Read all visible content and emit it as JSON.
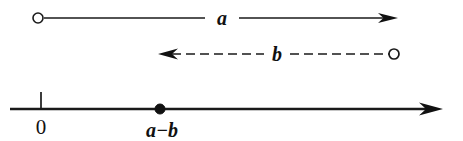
{
  "figure": {
    "background_color": "#ffffff",
    "ink_color": "#111111",
    "width": 463,
    "height": 141
  },
  "vectors": [
    {
      "id": "vector-a",
      "label": "a",
      "style": "solid",
      "direction": "right",
      "start_marker": "open-circle",
      "end_marker": "arrowhead",
      "start_x": 38,
      "end_x": 398,
      "y": 18,
      "label_x": 222,
      "label_y": 24,
      "label_gap_left": 205,
      "label_gap_right": 239,
      "stroke_width": 1.6
    },
    {
      "id": "vector-b",
      "label": "b",
      "style": "dashed",
      "direction": "left",
      "start_marker": "arrowhead",
      "end_marker": "open-circle",
      "start_x": 158,
      "end_x": 394,
      "y": 54,
      "label_x": 277,
      "label_y": 60,
      "label_gap_left": 264,
      "label_gap_right": 290,
      "stroke_width": 1.7,
      "dash_pattern": "9 5"
    }
  ],
  "number_line": {
    "id": "number-line",
    "y": 109,
    "start_x": 10,
    "end_x": 443,
    "stroke_width": 2.6,
    "end_marker": "arrowhead",
    "ticks": [
      {
        "id": "tick-zero",
        "label": "0",
        "x": 41,
        "tick_top_y": 92,
        "tick_bottom_y": 109,
        "label_x": 41,
        "label_y": 133,
        "marker": "tick"
      }
    ],
    "points": [
      {
        "id": "point-a-minus-b",
        "label": "a−b",
        "x": 160,
        "y": 109,
        "radius": 5,
        "marker": "filled-dot",
        "label_x": 162,
        "label_y": 136
      }
    ]
  },
  "typography": {
    "math_label_size": 20,
    "point_label_size": 20,
    "tick_label_size": 20
  }
}
